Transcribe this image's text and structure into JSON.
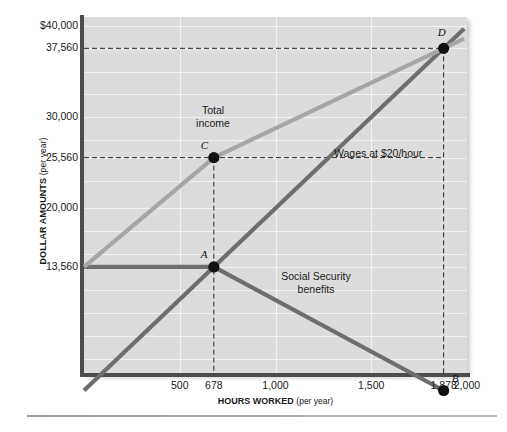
{
  "chart_data": {
    "type": "line",
    "title": "",
    "xlabel": "HOURS WORKED",
    "xlabel_sub": "(per year)",
    "ylabel": "DOLLAR AMOUNTS",
    "ylabel_sub": "(per year)",
    "xlim": [
      0,
      2000
    ],
    "ylim": [
      1700,
      41000
    ],
    "grid": true,
    "legend_position": "inline-annotations",
    "x_ticks": [
      {
        "value": 500,
        "label": "500"
      },
      {
        "value": 678,
        "label": "678"
      },
      {
        "value": 1000,
        "label": "1,000"
      },
      {
        "value": 1500,
        "label": "1,500"
      },
      {
        "value": 1878,
        "label": "1,878"
      },
      {
        "value": 2000,
        "label": "2,000"
      }
    ],
    "y_ticks": [
      {
        "value": 40000,
        "label": "$40,000"
      },
      {
        "value": 37560,
        "label": "37,560"
      },
      {
        "value": 30000,
        "label": "30,000"
      },
      {
        "value": 25560,
        "label": "25,560"
      },
      {
        "value": 20000,
        "label": "20,000"
      },
      {
        "value": 13560,
        "label": "13,560"
      }
    ],
    "gridlines_y": [
      40000,
      37560,
      35000,
      32500,
      30000,
      27500,
      25560,
      23000,
      20000,
      17500,
      15000,
      13560,
      11000,
      8500,
      6000,
      3500
    ],
    "gridlines_x": [
      500,
      1000,
      1500,
      2000
    ],
    "series": [
      {
        "name": "Wages at $20/hour",
        "color": "#6e6e6e",
        "points": [
          [
            0,
            0
          ],
          [
            1878,
            37560
          ]
        ]
      },
      {
        "name": "Social Security benefits",
        "color": "#6e6e6e",
        "points": [
          [
            0,
            13560
          ],
          [
            678,
            13560
          ],
          [
            1878,
            0
          ]
        ]
      },
      {
        "name": "Total income",
        "color": "#a6a6a6",
        "points": [
          [
            0,
            13560
          ],
          [
            678,
            25560
          ],
          [
            1878,
            37560
          ]
        ]
      }
    ],
    "annotations": [
      {
        "id": "total-income",
        "text_line1": "Total",
        "text_line2": "income"
      },
      {
        "id": "wages",
        "text_line1": "Wages at $20/hour",
        "text_line2": ""
      },
      {
        "id": "social-security",
        "text_line1": "Social Security",
        "text_line2": "benefits"
      }
    ],
    "points": [
      {
        "id": "A",
        "label": "A",
        "x": 678,
        "y": 13560
      },
      {
        "id": "B",
        "label": "B",
        "x": 1878,
        "y": 0
      },
      {
        "id": "C",
        "label": "C",
        "x": 678,
        "y": 25560
      },
      {
        "id": "D",
        "label": "D",
        "x": 1878,
        "y": 37560
      }
    ],
    "guide_lines": [
      {
        "id": "guide-37560",
        "orientation": "horizontal",
        "value": 37560
      },
      {
        "id": "guide-25560",
        "orientation": "horizontal",
        "value": 25560
      },
      {
        "id": "guide-678",
        "orientation": "vertical",
        "value": 678
      },
      {
        "id": "guide-1878",
        "orientation": "vertical",
        "value": 1878
      }
    ],
    "colors": {
      "plot_background": "#dcdcdc",
      "gridline": "#f2f2f2",
      "axis": "#4d4d4d",
      "series_dark": "#6e6e6e",
      "series_light": "#a6a6a6",
      "marker": "#111111"
    }
  }
}
